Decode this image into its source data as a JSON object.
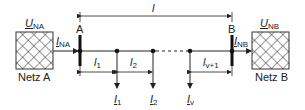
{
  "diagram": {
    "type": "two-side-fed power line with tapped loads",
    "nodes": {
      "netz_a": {
        "label": "Netz A",
        "voltage": "U",
        "voltage_sub": "NA",
        "current": "I",
        "current_sub": "NA"
      },
      "netz_b": {
        "label": "Netz B",
        "voltage": "U",
        "voltage_sub": "NB",
        "current": "I",
        "current_sub": "NB"
      },
      "bus_a": {
        "label": "A"
      },
      "bus_b": {
        "label": "B"
      }
    },
    "total_length": {
      "symbol": "l"
    },
    "segments": [
      {
        "symbol": "l",
        "sub": "1"
      },
      {
        "symbol": "l",
        "sub": "2"
      },
      {
        "symbol": "l",
        "sub": "v+1"
      }
    ],
    "loads": [
      {
        "symbol": "I",
        "sub": "1"
      },
      {
        "symbol": "I",
        "sub": "2"
      },
      {
        "symbol": "I",
        "sub": "v"
      }
    ],
    "colors": {
      "line": "#222222",
      "background": "#ffffff"
    }
  }
}
